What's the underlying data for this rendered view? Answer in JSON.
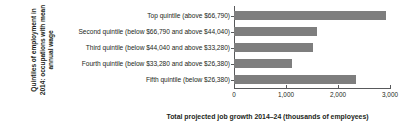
{
  "chart_data": {
    "type": "bar",
    "orientation": "horizontal",
    "title": "",
    "xlabel": "Total projected job growth 2014–24 (thousands of employees)",
    "ylabel": "Quintiles of employment in 2014: occupations with mean annual wage",
    "categories": [
      "Top quintile (above $66,790)",
      "Second quintile (below $66,790 and above $44,040)",
      "Third quintile (below $44,040 and above $33,280)",
      "Fourth quintile (below $33,280 and above $26,380)",
      "Fifth quintile (below $26,380)"
    ],
    "values": [
      2920,
      1605,
      1525,
      1120,
      2340
    ],
    "xlim": [
      0,
      3000
    ],
    "xticks": [
      0,
      1000,
      2000,
      3000
    ],
    "xtick_labels": [
      "0",
      "1,000",
      "2,000",
      "3,000"
    ],
    "grid": false,
    "legend": false,
    "bar_color": "#7e7e7e",
    "axis_color": "#58595b",
    "text_color": "#231f20",
    "background": "#ffffff"
  }
}
